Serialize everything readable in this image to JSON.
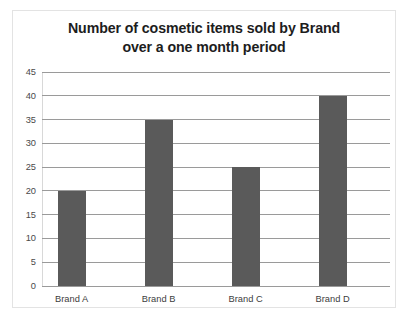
{
  "chart_data": {
    "type": "bar",
    "title": "Number of cosmetic items sold by Brand over a one month period",
    "title_lines": [
      "Number of cosmetic items sold by Brand",
      "over a one month period"
    ],
    "categories": [
      "Brand A",
      "Brand B",
      "Brand C",
      "Brand D"
    ],
    "values": [
      20,
      35,
      25,
      40
    ],
    "xlabel": "",
    "ylabel": "",
    "ylim": [
      0,
      45
    ],
    "ytick_step": 5,
    "yticks": [
      0,
      5,
      10,
      15,
      20,
      25,
      30,
      35,
      40,
      45
    ],
    "grid": "horizontal",
    "legend": "none",
    "bar_color": "#5a5a5a",
    "gridline_color": "#9a9a9a",
    "background_color": "#ffffff",
    "border_color": "#e3e3e3",
    "title_color": "#1d1d1d"
  }
}
